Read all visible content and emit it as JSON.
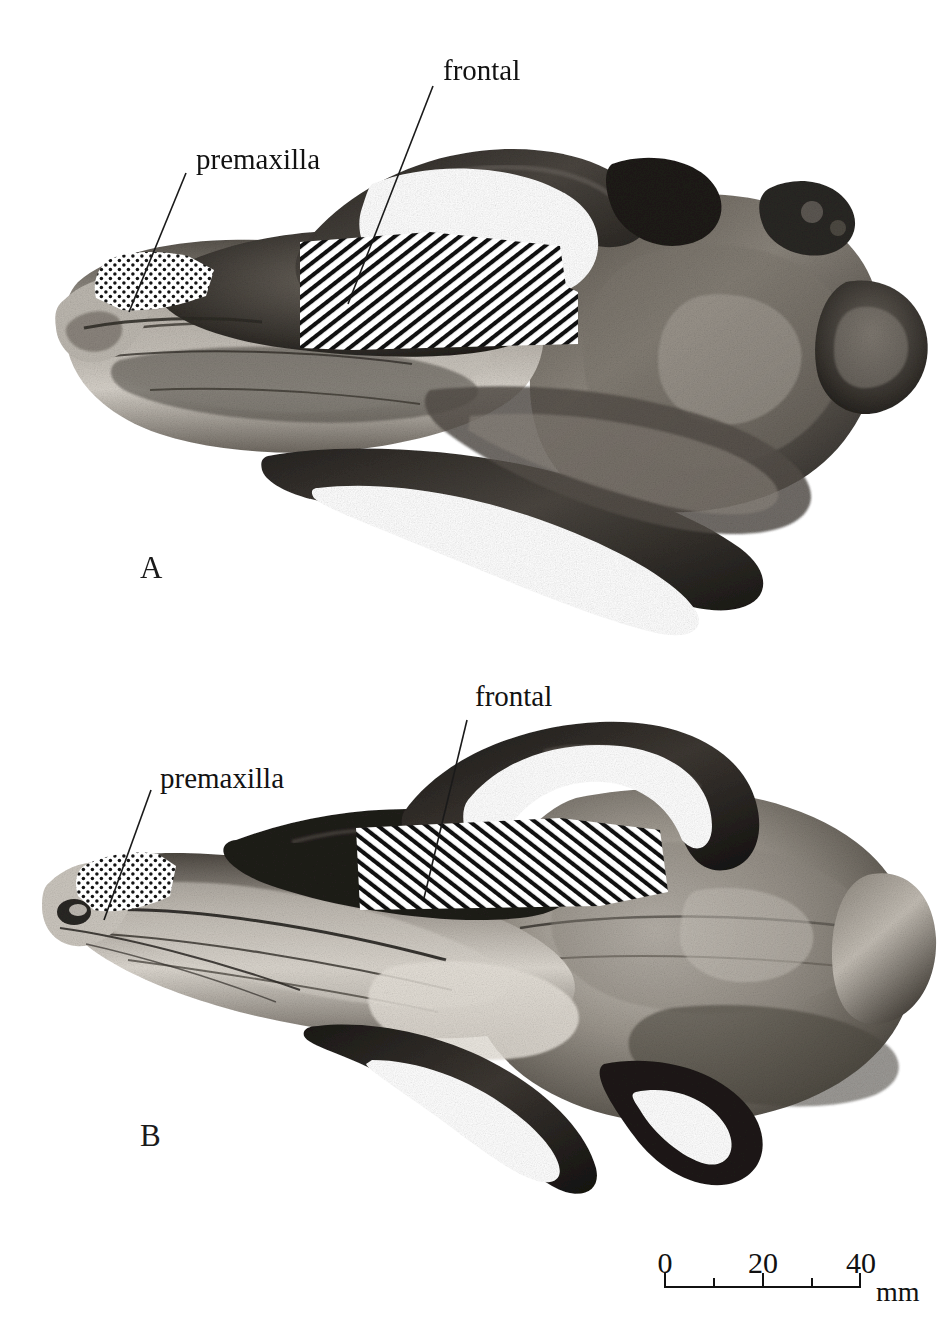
{
  "figure": {
    "type": "comparative-anatomy-plate",
    "background_color": "#ffffff",
    "ink_color": "#111111"
  },
  "panels": [
    {
      "id": "A",
      "letter": "A",
      "view": "dorsal",
      "annotations": [
        {
          "label": "premaxilla",
          "pattern": "stipple",
          "pattern_name": "dotted"
        },
        {
          "label": "frontal",
          "pattern": "hatch",
          "pattern_name": "diagonal-hatch-down-right"
        }
      ]
    },
    {
      "id": "B",
      "letter": "B",
      "view": "dorsal",
      "annotations": [
        {
          "label": "premaxilla",
          "pattern": "stipple",
          "pattern_name": "dotted"
        },
        {
          "label": "frontal",
          "pattern": "hatch",
          "pattern_name": "diagonal-hatch-down-left"
        }
      ]
    }
  ],
  "labels": {
    "a_premaxilla": "premaxilla",
    "a_frontal": "frontal",
    "b_premaxilla": "premaxilla",
    "b_frontal": "frontal"
  },
  "scale_bar": {
    "unit": "mm",
    "unit_label": "mm",
    "ticks": [
      {
        "value": 0,
        "label": "0",
        "major": true
      },
      {
        "value": 10,
        "label": "",
        "major": false
      },
      {
        "value": 20,
        "label": "20",
        "major": true
      },
      {
        "value": 30,
        "label": "",
        "major": false
      },
      {
        "value": 40,
        "label": "40",
        "major": true
      }
    ],
    "min": 0,
    "max": 40,
    "length_px": 196
  }
}
